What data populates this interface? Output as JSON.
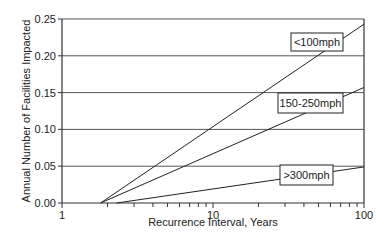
{
  "chart_data": {
    "type": "line",
    "title": "",
    "xlabel": "Recurrence Interval, Years",
    "ylabel": "Annual Number of Facilities Impacted",
    "xscale": "log",
    "xlim": [
      1,
      100
    ],
    "ylim": [
      0,
      0.25
    ],
    "x_ticks": [
      1,
      10,
      100
    ],
    "x_tick_labels": [
      "1",
      "10",
      "100"
    ],
    "y_ticks": [
      0.0,
      0.05,
      0.1,
      0.15,
      0.2,
      0.25
    ],
    "y_tick_labels": [
      "0.00",
      "0.05",
      "0.10",
      "0.15",
      "0.20",
      "0.25"
    ],
    "grid": {
      "horizontal": true,
      "vertical": false
    },
    "legend": "inline labels (boxed) near right end of each line",
    "series": [
      {
        "name": "<100mph",
        "x": [
          1.8,
          100
        ],
        "y": [
          0.0,
          0.243
        ],
        "label_box": {
          "x": 291,
          "y": 33,
          "w": 52,
          "h": 18
        }
      },
      {
        "name": "150-250mph",
        "x": [
          1.8,
          100
        ],
        "y": [
          0.0,
          0.157
        ],
        "label_box": {
          "x": 278,
          "y": 93,
          "w": 65,
          "h": 20
        }
      },
      {
        "name": ">300mph",
        "x": [
          2.3,
          100
        ],
        "y": [
          0.0,
          0.049
        ],
        "label_box": {
          "x": 280,
          "y": 165,
          "w": 53,
          "h": 20
        }
      }
    ],
    "colors": {
      "line": "#222222",
      "grid": "#555555",
      "axis": "#333333"
    }
  }
}
